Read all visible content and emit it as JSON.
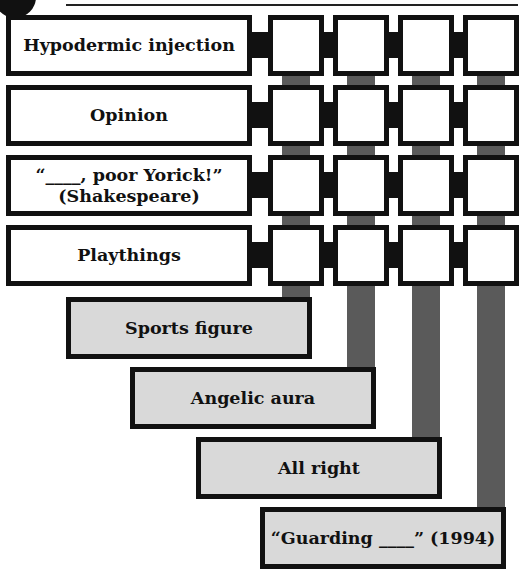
{
  "puzzle": {
    "across_clues": [
      {
        "label": "Hypodermic injection"
      },
      {
        "label": "Opinion"
      },
      {
        "label": "“____, poor Yorick!” (Shakespeare)",
        "line1": "“____, poor Yorick!”",
        "line2": "(Shakespeare)"
      },
      {
        "label": "Playthings"
      }
    ],
    "down_clues": [
      {
        "label": "Sports figure"
      },
      {
        "label": "Angelic aura"
      },
      {
        "label": "All right"
      },
      {
        "label": "“Guarding ____” (1994)"
      }
    ],
    "grid": {
      "rows": 4,
      "cols": 4,
      "cells": [
        [
          "",
          "",
          "",
          ""
        ],
        [
          "",
          "",
          "",
          ""
        ],
        [
          "",
          "",
          "",
          ""
        ],
        [
          "",
          "",
          "",
          ""
        ]
      ]
    },
    "colors": {
      "border": "#111111",
      "down_clue_fill": "#d9d9d9",
      "connector_grey": "#5a5a5a"
    }
  }
}
